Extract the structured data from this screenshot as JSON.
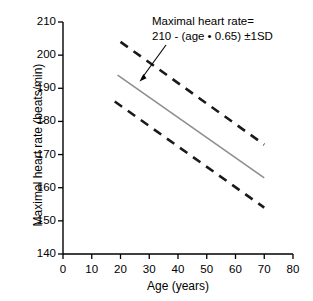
{
  "chart_data": {
    "type": "line",
    "title": "",
    "xlabel": "Age (years)",
    "ylabel": "Maximal heart rate (beats/min)",
    "xlim": [
      0,
      80
    ],
    "ylim": [
      140,
      210
    ],
    "xticks": [
      0,
      10,
      20,
      30,
      40,
      50,
      60,
      70,
      80
    ],
    "yticks": [
      140,
      150,
      160,
      170,
      180,
      190,
      200,
      210
    ],
    "xtick_labels": [
      "0",
      "10",
      "20",
      "30",
      "40",
      "50",
      "60",
      "70",
      "80"
    ],
    "ytick_labels": [
      "140",
      "150",
      "160",
      "170",
      "180",
      "190",
      "200",
      "210"
    ],
    "grid": false,
    "legend": null,
    "annotations": [
      {
        "text_line_1": "Maximal heart rate=",
        "text_line_2": "210 - (age • 0.65) ±1SD",
        "arrow_from_x": 39,
        "arrow_from_y": 197,
        "arrow_to_x": 27,
        "arrow_to_y": 191
      }
    ],
    "series": [
      {
        "name": "Maximal heart rate (mean)",
        "style": "solid",
        "color": "#8c8c8c",
        "x": [
          19,
          70
        ],
        "values": [
          194,
          163
        ]
      },
      {
        "name": "+1 SD",
        "style": "dashed",
        "color": "#1a1a1a",
        "x": [
          20,
          70
        ],
        "values": [
          204,
          173
        ]
      },
      {
        "name": "-1 SD",
        "style": "dashed",
        "color": "#1a1a1a",
        "x": [
          18,
          70
        ],
        "values": [
          186,
          154
        ]
      }
    ]
  },
  "figure": {
    "axis_color": "#000000",
    "background": "#ffffff"
  }
}
